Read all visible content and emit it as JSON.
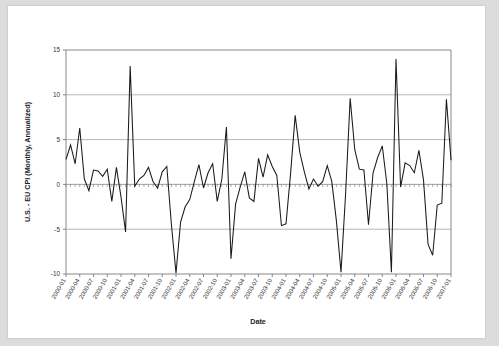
{
  "chart_data": {
    "type": "line",
    "title": "",
    "xlabel": "Date",
    "ylabel": "U.S. - EU CPI (Monthly, Annualized)",
    "ylim": [
      -10,
      15
    ],
    "yticks": [
      15,
      10,
      5,
      0,
      -5,
      -10
    ],
    "grid": true,
    "legend": "none",
    "x_tick_labels": [
      "2000-01",
      "2000-04",
      "2000-07",
      "2000-10",
      "2001-01",
      "2001-04",
      "2001-07",
      "2001-10",
      "2002-01",
      "2002-04",
      "2002-07",
      "2002-10",
      "2003-01",
      "2003-04",
      "2003-07",
      "2003-10",
      "2004-01",
      "2004-04",
      "2004-07",
      "2004-10",
      "2005-01",
      "2005-04",
      "2005-07",
      "2005-10",
      "2006-01",
      "2006-04",
      "2006-07",
      "2006-10",
      "2007-01"
    ],
    "x_tick_interval_months": 3,
    "x_start": "2000-01",
    "x_end": "2007-01",
    "series": [
      {
        "name": "U.S. - EU CPI (Monthly, Annualized)",
        "color": "#1a1a1a",
        "x": [
          "2000-01",
          "2000-02",
          "2000-03",
          "2000-04",
          "2000-05",
          "2000-06",
          "2000-07",
          "2000-08",
          "2000-09",
          "2000-10",
          "2000-11",
          "2000-12",
          "2001-01",
          "2001-02",
          "2001-03",
          "2001-04",
          "2001-05",
          "2001-06",
          "2001-07",
          "2001-08",
          "2001-09",
          "2001-10",
          "2001-11",
          "2001-12",
          "2002-01",
          "2002-02",
          "2002-03",
          "2002-04",
          "2002-05",
          "2002-06",
          "2002-07",
          "2002-08",
          "2002-09",
          "2002-10",
          "2002-11",
          "2002-12",
          "2003-01",
          "2003-02",
          "2003-03",
          "2003-04",
          "2003-05",
          "2003-06",
          "2003-07",
          "2003-08",
          "2003-09",
          "2003-10",
          "2003-11",
          "2003-12",
          "2004-01",
          "2004-02",
          "2004-03",
          "2004-04",
          "2004-05",
          "2004-06",
          "2004-07",
          "2004-08",
          "2004-09",
          "2004-10",
          "2004-11",
          "2004-12",
          "2005-01",
          "2005-02",
          "2005-03",
          "2005-04",
          "2005-05",
          "2005-06",
          "2005-07",
          "2005-08",
          "2005-09",
          "2005-10",
          "2005-11",
          "2005-12",
          "2006-01",
          "2006-02",
          "2006-03",
          "2006-04",
          "2006-05",
          "2006-06",
          "2006-07",
          "2006-08",
          "2006-09",
          "2006-10",
          "2006-11",
          "2006-12",
          "2007-01"
        ],
        "values": [
          2.8,
          4.4,
          2.3,
          6.3,
          0.6,
          -0.7,
          1.6,
          1.5,
          0.9,
          1.7,
          -1.9,
          1.9,
          -1.4,
          -5.3,
          13.2,
          -0.2,
          0.6,
          1.0,
          1.9,
          0.3,
          -0.4,
          1.4,
          2.0,
          -4.5,
          -9.9,
          -4.2,
          -2.5,
          -1.7,
          0.3,
          2.2,
          -0.4,
          1.3,
          2.3,
          -1.9,
          0.6,
          6.4,
          -8.3,
          -2.2,
          -0.3,
          1.4,
          -1.5,
          -1.9,
          2.9,
          0.8,
          3.3,
          2.0,
          1.0,
          -4.6,
          -4.4,
          1.2,
          7.7,
          3.6,
          1.4,
          -0.5,
          0.6,
          -0.2,
          0.3,
          2.1,
          0.3,
          -4.1,
          -9.8,
          -1.1,
          9.6,
          3.9,
          1.7,
          1.6,
          -4.5,
          1.3,
          3.0,
          4.3,
          0.1,
          -9.8,
          14.0,
          -0.3,
          2.4,
          2.1,
          1.3,
          3.8,
          0.5,
          -6.7,
          -7.9,
          -2.3,
          -2.1,
          9.5,
          2.7
        ]
      }
    ]
  },
  "axes": {
    "y_axis_title": "U.S. - EU CPI (Monthly, Annualized)",
    "x_axis_title": "Date"
  }
}
